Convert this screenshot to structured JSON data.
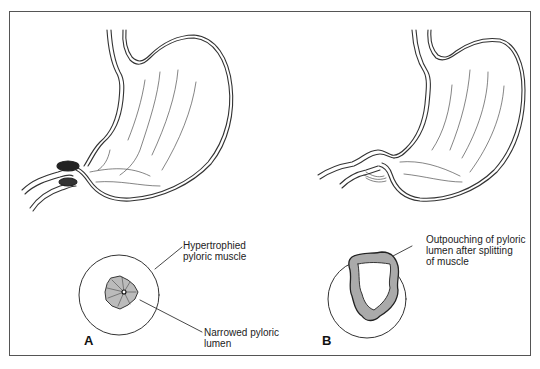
{
  "figure": {
    "panels": [
      {
        "id": "A",
        "letter": "A",
        "description": "Stomach with hypertrophied pyloric muscle",
        "labels": [
          {
            "text": "Hypertrophied\npyloric muscle"
          },
          {
            "text": "Narrowed pyloric\nlumen"
          }
        ]
      },
      {
        "id": "B",
        "letter": "B",
        "description": "Stomach after pyloromyotomy",
        "labels": [
          {
            "text": "Outpouching of pyloric\nlumen after splitting\nof muscle"
          }
        ]
      }
    ]
  }
}
